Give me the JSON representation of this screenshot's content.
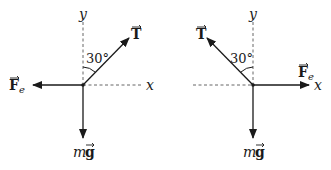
{
  "diagrams": [
    {
      "name": "left-free-body",
      "axes": {
        "x": "x",
        "y": "y"
      },
      "angle_label": "30°",
      "forces": {
        "tension": {
          "symbol": "T",
          "direction": "up-right, 30° from +y"
        },
        "electric": {
          "symbol": "F",
          "subscript": "e",
          "direction": "-x"
        },
        "gravity": {
          "prefix": "m",
          "symbol": "g",
          "direction": "-y"
        }
      }
    },
    {
      "name": "right-free-body",
      "axes": {
        "x": "x",
        "y": "y"
      },
      "angle_label": "30°",
      "forces": {
        "tension": {
          "symbol": "T",
          "direction": "up-left, 30° from +y"
        },
        "electric": {
          "symbol": "F",
          "subscript": "e",
          "direction": "+x"
        },
        "gravity": {
          "prefix": "m",
          "symbol": "g",
          "direction": "-y"
        }
      }
    }
  ],
  "colors": {
    "line": "#1a1a1a",
    "axis_dash": "#555555"
  }
}
